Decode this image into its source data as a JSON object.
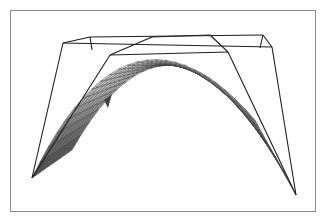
{
  "chart_data": {
    "type": "surface3d",
    "title": "",
    "xlabel": "",
    "ylabel": "",
    "zlabel": "",
    "mesh": {
      "rows": 10,
      "cols": 24
    },
    "grid": true,
    "legend": null,
    "surface_colors": {
      "light": "#f2f2f2",
      "mid": "#a8a8a8",
      "dark": "#555555",
      "mesh": "#3a3a3a"
    },
    "box_color": "#1e1e1e",
    "frame_color": "#8a8a8a"
  },
  "geometry": {
    "box_lines": [
      [
        63,
        43,
        90,
        37
      ],
      [
        90,
        37,
        263,
        35
      ],
      [
        263,
        35,
        272,
        47
      ],
      [
        63,
        43,
        272,
        47
      ],
      [
        90,
        37,
        92,
        50
      ],
      [
        263,
        35,
        260,
        48
      ],
      [
        110,
        55,
        152,
        37
      ],
      [
        152,
        37,
        210,
        35
      ],
      [
        210,
        35,
        228,
        52
      ],
      [
        110,
        55,
        228,
        52
      ],
      [
        63,
        43,
        32,
        178
      ],
      [
        272,
        47,
        296,
        195
      ],
      [
        110,
        55,
        32,
        178
      ],
      [
        228,
        52,
        296,
        195
      ]
    ],
    "surface": {
      "back_left": [
        110,
        55
      ],
      "back_right": [
        228,
        52
      ],
      "top_left": [
        60,
        85
      ],
      "top_right": [
        290,
        70
      ],
      "tip_left": [
        32,
        178
      ],
      "tip_right": [
        296,
        195
      ],
      "crest_back": [
        165,
        45
      ],
      "crest_front": [
        175,
        62
      ],
      "under_mid": [
        165,
        95
      ]
    }
  }
}
